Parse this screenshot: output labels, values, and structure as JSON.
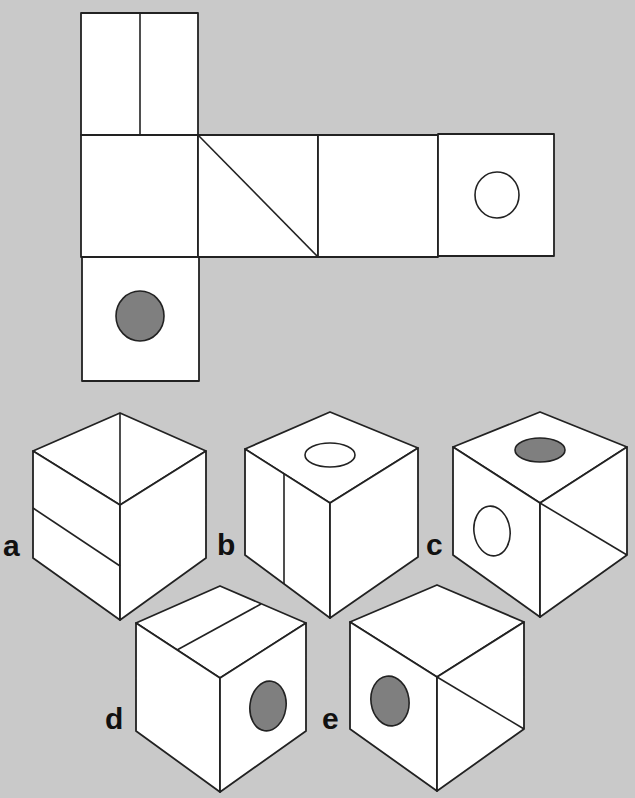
{
  "puzzle": {
    "type": "cube-net-folding",
    "background_color": "#c9c9c9",
    "filled_circle_color": "#7f7f7f",
    "net": {
      "squares": [
        {
          "id": "top",
          "marking": "vertical-line"
        },
        {
          "id": "middle-1",
          "marking": "blank"
        },
        {
          "id": "middle-2",
          "marking": "diagonal-line"
        },
        {
          "id": "middle-3",
          "marking": "blank"
        },
        {
          "id": "middle-4",
          "marking": "open-circle"
        },
        {
          "id": "bottom",
          "marking": "filled-circle"
        }
      ]
    },
    "options": [
      {
        "label": "a",
        "top": "diagonal-line",
        "left": "horizontal-slant-line",
        "right": "blank"
      },
      {
        "label": "b",
        "top": "open-circle",
        "left": "vertical-line",
        "right": "blank"
      },
      {
        "label": "c",
        "top": "filled-circle",
        "left": "open-circle",
        "right": "diagonal-line"
      },
      {
        "label": "d",
        "top": "line",
        "left": "blank",
        "right": "filled-circle"
      },
      {
        "label": "e",
        "top": "blank",
        "left": "filled-circle",
        "right": "diagonal-line"
      }
    ]
  }
}
